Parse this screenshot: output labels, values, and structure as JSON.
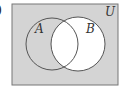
{
  "figure": {
    "part_label": ")",
    "universe_label": "U",
    "set_a_label": "A",
    "set_b_label": "B",
    "shaded_region": "complement of B (B')",
    "colors": {
      "shade": "#d4d4d4",
      "unshaded": "#ffffff",
      "outline": "#555555"
    }
  }
}
